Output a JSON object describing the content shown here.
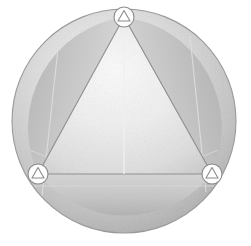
{
  "scene": {
    "title": "Circular reflector disc with triangular panel",
    "background_color": "#ffffff",
    "canvas": {
      "width": 251,
      "height": 246
    }
  },
  "disc": {
    "name": "circular-disc",
    "center_x": 124,
    "center_y": 121,
    "radius_x": 112,
    "radius_y": 112,
    "outline_color": "#9a9a9a",
    "fill_light": "#f2f2f2",
    "fill_mid": "#cfcfcf",
    "fill_dark": "#a8a8a8",
    "texture": "fabric-noise"
  },
  "panel": {
    "name": "triangular-panel",
    "shape": "triangle",
    "fill_light": "#fbfbfb",
    "fill_mid": "#e8e8e8",
    "fill_edge": "#d2d2d2",
    "edge_color": "#8f8f8f",
    "vertices": [
      {
        "label": "top",
        "x": 124,
        "y": 17
      },
      {
        "label": "bottom-left",
        "x": 38,
        "y": 174
      },
      {
        "label": "bottom-right",
        "x": 212,
        "y": 174
      }
    ]
  },
  "segments": [
    {
      "name": "left-segment",
      "shade": "#c4c4c4",
      "label": "left circular segment"
    },
    {
      "name": "right-segment",
      "shade": "#bdbdbd",
      "label": "right circular segment"
    },
    {
      "name": "bottom-segment",
      "shade": "#c9c9c9",
      "label": "bottom circular segment"
    }
  ],
  "creases": [
    {
      "name": "left-crease",
      "x1": 60,
      "y1": 30,
      "x2": 42,
      "y2": 196,
      "color": "#d8d8d8"
    },
    {
      "name": "right-crease",
      "x1": 190,
      "y1": 36,
      "x2": 206,
      "y2": 192,
      "color": "#d8d8d8"
    },
    {
      "name": "bottom-crease",
      "x1": 40,
      "y1": 182,
      "x2": 210,
      "y2": 182,
      "color": "#d4d4d4"
    }
  ],
  "badges": [
    {
      "name": "vertex-badge-top",
      "icon": "triangle-in-circle-icon",
      "cx": 124,
      "cy": 17,
      "r": 10,
      "circle_fill": "#fdfdfd",
      "circle_stroke": "#8c8c8c",
      "triangle_stroke": "#8c8c8c",
      "triangle_fill": "#ffffff"
    },
    {
      "name": "vertex-badge-bottom-left",
      "icon": "triangle-in-circle-icon",
      "cx": 38,
      "cy": 174,
      "r": 10,
      "circle_fill": "#fdfdfd",
      "circle_stroke": "#8c8c8c",
      "triangle_stroke": "#8c8c8c",
      "triangle_fill": "#ffffff"
    },
    {
      "name": "vertex-badge-bottom-right",
      "icon": "triangle-in-circle-icon",
      "cx": 212,
      "cy": 174,
      "r": 10,
      "circle_fill": "#fdfdfd",
      "circle_stroke": "#8c8c8c",
      "triangle_stroke": "#8c8c8c",
      "triangle_fill": "#ffffff"
    }
  ]
}
